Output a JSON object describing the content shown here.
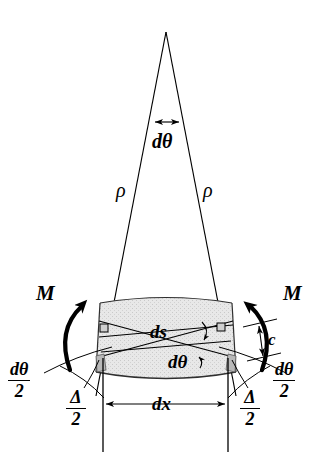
{
  "figure": {
    "colors": {
      "line": "#000000",
      "shade_fill": "#e4e4e4",
      "shade_stroke": "#3a3a3a",
      "arrow_bold": "#000000",
      "background": "#ffffff"
    },
    "labels": {
      "rho_left": "ρ",
      "rho_right": "ρ",
      "dtheta_top": "dθ",
      "moment_left": "M",
      "moment_right": "M",
      "ds": "ds",
      "dtheta_inner": "dθ",
      "c": "c",
      "dx": "dx",
      "dtheta_half_left_num": "dθ",
      "dtheta_half_left_den": "2",
      "dtheta_half_right_num": "dθ",
      "dtheta_half_right_den": "2",
      "delta_half_left_num": "Δ",
      "delta_half_left_den": "2",
      "delta_half_right_num": "Δ",
      "delta_half_right_den": "2"
    },
    "geometry": {
      "apex_x": 166,
      "apex_y": 32,
      "left_ray_end_x": 96,
      "right_ray_end_x": 236,
      "ray_end_y": 396,
      "element_top_y": 298,
      "element_bottom_y": 378,
      "dx_line_y": 404,
      "dx_left_x": 103,
      "dx_right_x": 228,
      "dtheta_arrow_y": 122,
      "dtheta_arrow_left_x": 152,
      "dtheta_arrow_right_x": 182
    }
  }
}
